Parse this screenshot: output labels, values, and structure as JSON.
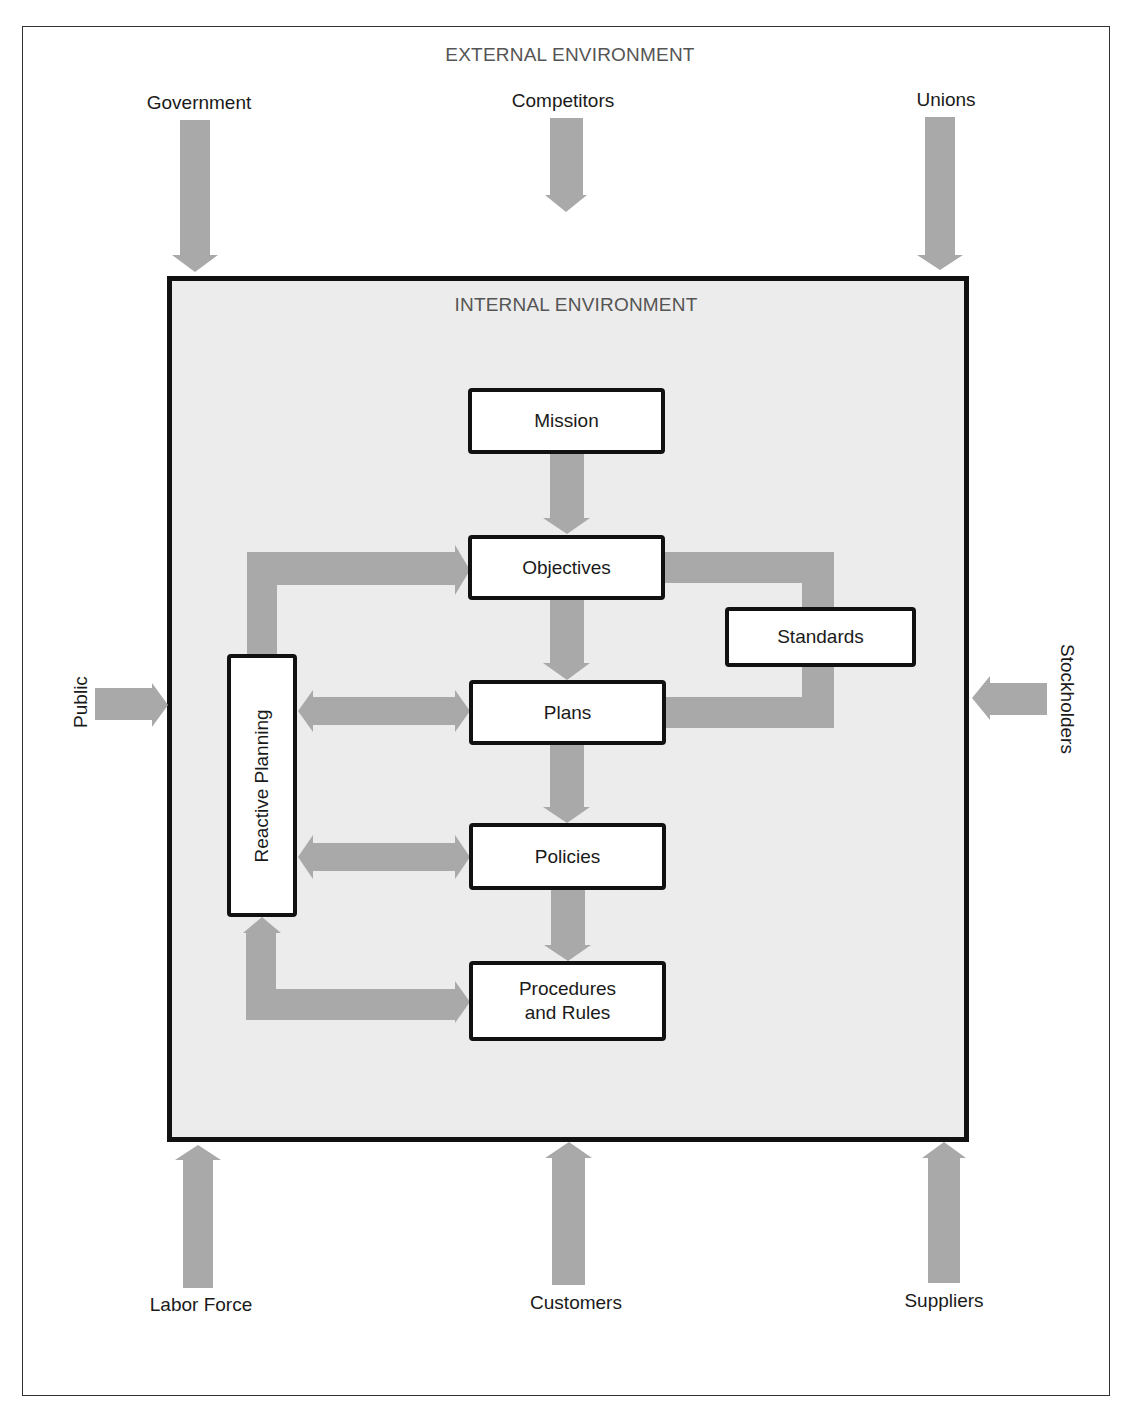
{
  "external": {
    "title": "EXTERNAL ENVIRONMENT",
    "forces": {
      "government": "Government",
      "competitors": "Competitors",
      "unions": "Unions",
      "public": "Public",
      "stockholders": "Stockholders",
      "labor_force": "Labor Force",
      "customers": "Customers",
      "suppliers": "Suppliers"
    }
  },
  "internal": {
    "title": "INTERNAL ENVIRONMENT",
    "boxes": {
      "mission": "Mission",
      "objectives": "Objectives",
      "standards": "Standards",
      "plans": "Plans",
      "policies": "Policies",
      "procedures": "Procedures\nand Rules",
      "reactive_planning": "Reactive Planning"
    }
  },
  "colors": {
    "arrow": "#a9a9a9",
    "internal_bg": "#ececec",
    "border": "#111111"
  }
}
